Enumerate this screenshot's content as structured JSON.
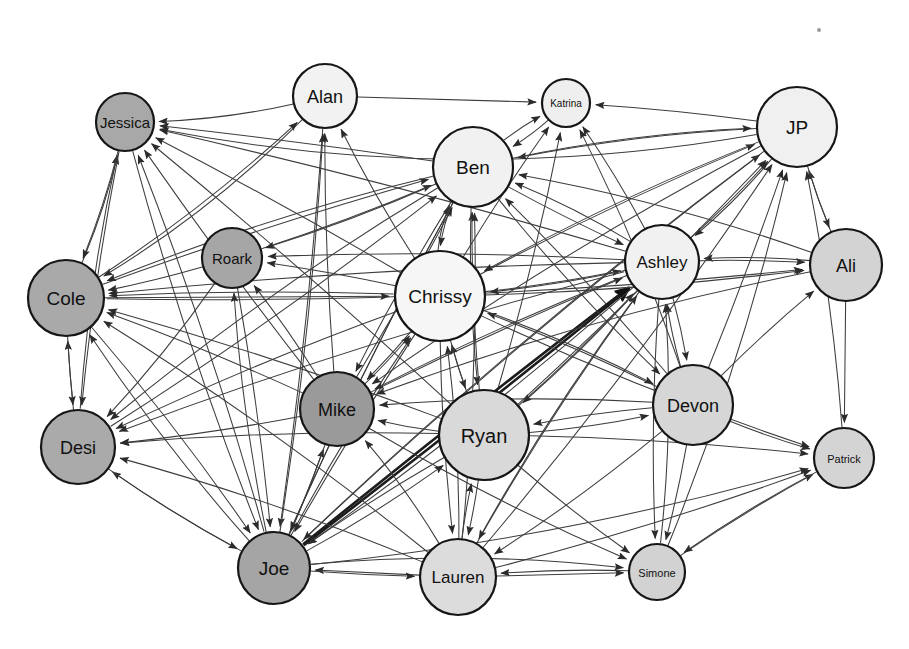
{
  "diagram": {
    "type": "directed-social-network-graph",
    "title": "",
    "background_color": "#ffffff",
    "edge_color": "#3d3d3d",
    "node_border_color": "#161616",
    "width": 909,
    "height": 649,
    "node_count": 18,
    "edge_count": 146
  },
  "nodes": [
    {
      "id": "jessica",
      "label": "Jessica",
      "x": 125,
      "y": 122,
      "r": 29,
      "fill": "#a8a8a8",
      "font_size": 15
    },
    {
      "id": "alan",
      "label": "Alan",
      "x": 325,
      "y": 96,
      "r": 32,
      "fill": "#f2f2f2",
      "font_size": 18
    },
    {
      "id": "katrina",
      "label": "Katrina",
      "x": 566,
      "y": 103,
      "r": 24,
      "fill": "#efefef",
      "font_size": 10
    },
    {
      "id": "jp",
      "label": "JP",
      "x": 797,
      "y": 127,
      "r": 40,
      "fill": "#f0f0f0",
      "font_size": 19
    },
    {
      "id": "ben",
      "label": "Ben",
      "x": 473,
      "y": 167,
      "r": 40,
      "fill": "#f1f1f1",
      "font_size": 19
    },
    {
      "id": "roark",
      "label": "Roark",
      "x": 232,
      "y": 258,
      "r": 30,
      "fill": "#a6a6a6",
      "font_size": 15
    },
    {
      "id": "ashley",
      "label": "Ashley",
      "x": 662,
      "y": 262,
      "r": 37,
      "fill": "#f1f1f1",
      "font_size": 17
    },
    {
      "id": "ali",
      "label": "Ali",
      "x": 846,
      "y": 265,
      "r": 36,
      "fill": "#d3d3d3",
      "font_size": 18
    },
    {
      "id": "cole",
      "label": "Cole",
      "x": 66,
      "y": 298,
      "r": 38,
      "fill": "#a9a9a9",
      "font_size": 19
    },
    {
      "id": "chrissy",
      "label": "Chrissy",
      "x": 440,
      "y": 296,
      "r": 45,
      "fill": "#f6f6f6",
      "font_size": 19
    },
    {
      "id": "mike",
      "label": "Mike",
      "x": 337,
      "y": 409,
      "r": 37,
      "fill": "#9a9a9a",
      "font_size": 18
    },
    {
      "id": "devon",
      "label": "Devon",
      "x": 693,
      "y": 405,
      "r": 40,
      "fill": "#d6d6d6",
      "font_size": 18
    },
    {
      "id": "ryan",
      "label": "Ryan",
      "x": 484,
      "y": 435,
      "r": 45,
      "fill": "#d9d9d9",
      "font_size": 20
    },
    {
      "id": "desi",
      "label": "Desi",
      "x": 78,
      "y": 447,
      "r": 37,
      "fill": "#aaaaaa",
      "font_size": 18
    },
    {
      "id": "patrick",
      "label": "Patrick",
      "x": 844,
      "y": 458,
      "r": 30,
      "fill": "#d4d4d4",
      "font_size": 11
    },
    {
      "id": "joe",
      "label": "Joe",
      "x": 274,
      "y": 568,
      "r": 36,
      "fill": "#a5a5a5",
      "font_size": 19
    },
    {
      "id": "lauren",
      "label": "Lauren",
      "x": 458,
      "y": 577,
      "r": 38,
      "fill": "#dcdcdc",
      "font_size": 17
    },
    {
      "id": "simone",
      "label": "Simone",
      "x": 657,
      "y": 572,
      "r": 28,
      "fill": "#d2d2d2",
      "font_size": 11
    }
  ],
  "edges": [
    {
      "from": "jp",
      "to": "jessica",
      "curve": -70,
      "thick": false
    },
    {
      "from": "alan",
      "to": "jessica",
      "curve": -14,
      "thick": false
    },
    {
      "from": "alan",
      "to": "katrina",
      "curve": 0,
      "thick": false
    },
    {
      "from": "jp",
      "to": "katrina",
      "curve": 6,
      "thick": false
    },
    {
      "from": "ben",
      "to": "katrina",
      "curve": -10,
      "thick": false
    },
    {
      "from": "ashley",
      "to": "katrina",
      "curve": 8,
      "thick": false
    },
    {
      "from": "chrissy",
      "to": "katrina",
      "curve": -6,
      "thick": false
    },
    {
      "from": "ryan",
      "to": "katrina",
      "curve": 10,
      "thick": false
    },
    {
      "from": "devon",
      "to": "katrina",
      "curve": 14,
      "thick": false
    },
    {
      "from": "cole",
      "to": "jessica",
      "curve": 12,
      "thick": false
    },
    {
      "from": "desi",
      "to": "jessica",
      "curve": -16,
      "thick": false
    },
    {
      "from": "ben",
      "to": "jessica",
      "curve": 4,
      "thick": false
    },
    {
      "from": "chrissy",
      "to": "jessica",
      "curve": 6,
      "thick": false
    },
    {
      "from": "ashley",
      "to": "jessica",
      "curve": 10,
      "thick": false
    },
    {
      "from": "ryan",
      "to": "jessica",
      "curve": 8,
      "thick": false
    },
    {
      "from": "mike",
      "to": "jessica",
      "curve": -6,
      "thick": false
    },
    {
      "from": "joe",
      "to": "jessica",
      "curve": 14,
      "thick": false
    },
    {
      "from": "jp",
      "to": "ben",
      "curve": 16,
      "thick": false
    },
    {
      "from": "ali",
      "to": "ben",
      "curve": 20,
      "thick": false
    },
    {
      "from": "katrina",
      "to": "ben",
      "curve": -12,
      "thick": false
    },
    {
      "from": "chrissy",
      "to": "ben",
      "curve": -30,
      "thick": false
    },
    {
      "from": "ashley",
      "to": "ben",
      "curve": 14,
      "thick": false
    },
    {
      "from": "cole",
      "to": "ben",
      "curve": -10,
      "thick": false
    },
    {
      "from": "roark",
      "to": "ben",
      "curve": 8,
      "thick": false
    },
    {
      "from": "mike",
      "to": "ben",
      "curve": 6,
      "thick": false
    },
    {
      "from": "ryan",
      "to": "ben",
      "curve": -10,
      "thick": false
    },
    {
      "from": "desi",
      "to": "ben",
      "curve": 14,
      "thick": false
    },
    {
      "from": "joe",
      "to": "ben",
      "curve": -12,
      "thick": false
    },
    {
      "from": "lauren",
      "to": "ben",
      "curve": 16,
      "thick": false
    },
    {
      "from": "devon",
      "to": "ben",
      "curve": 10,
      "thick": false
    },
    {
      "from": "ben",
      "to": "ashley",
      "curve": 6,
      "thick": false
    },
    {
      "from": "jp",
      "to": "ashley",
      "curve": -14,
      "thick": false
    },
    {
      "from": "ali",
      "to": "ashley",
      "curve": 12,
      "thick": false
    },
    {
      "from": "chrissy",
      "to": "ashley",
      "curve": 8,
      "thick": false
    },
    {
      "from": "devon",
      "to": "ashley",
      "curve": -10,
      "thick": false
    },
    {
      "from": "ryan",
      "to": "ashley",
      "curve": 10,
      "thick": false
    },
    {
      "from": "lauren",
      "to": "ashley",
      "curve": -14,
      "thick": false
    },
    {
      "from": "joe",
      "to": "ashley",
      "curve": 4,
      "thick": true
    },
    {
      "from": "joe",
      "to": "ashley",
      "curve": -4,
      "thick": true
    },
    {
      "from": "mike",
      "to": "ashley",
      "curve": -8,
      "thick": false
    },
    {
      "from": "simone",
      "to": "ashley",
      "curve": 18,
      "thick": false
    },
    {
      "from": "ashley",
      "to": "jp",
      "curve": 10,
      "thick": false
    },
    {
      "from": "ali",
      "to": "jp",
      "curve": -8,
      "thick": false
    },
    {
      "from": "devon",
      "to": "jp",
      "curve": 6,
      "thick": false
    },
    {
      "from": "patrick",
      "to": "jp",
      "curve": 14,
      "thick": false
    },
    {
      "from": "chrissy",
      "to": "jp",
      "curve": -12,
      "thick": false
    },
    {
      "from": "ryan",
      "to": "jp",
      "curve": 10,
      "thick": false
    },
    {
      "from": "lauren",
      "to": "jp",
      "curve": 18,
      "thick": false
    },
    {
      "from": "simone",
      "to": "jp",
      "curve": 22,
      "thick": false
    },
    {
      "from": "joe",
      "to": "jp",
      "curve": -22,
      "thick": false
    },
    {
      "from": "ben",
      "to": "jp",
      "curve": -18,
      "thick": false
    },
    {
      "from": "jp",
      "to": "ali",
      "curve": 8,
      "thick": false
    },
    {
      "from": "ashley",
      "to": "ali",
      "curve": -6,
      "thick": false
    },
    {
      "from": "cole",
      "to": "ali",
      "curve": 26,
      "thick": false
    },
    {
      "from": "chrissy",
      "to": "ali",
      "curve": 12,
      "thick": false
    },
    {
      "from": "devon",
      "to": "ali",
      "curve": -8,
      "thick": false
    },
    {
      "from": "ali",
      "to": "patrick",
      "curve": 0,
      "thick": false
    },
    {
      "from": "devon",
      "to": "patrick",
      "curve": 8,
      "thick": false
    },
    {
      "from": "ryan",
      "to": "patrick",
      "curve": -10,
      "thick": false
    },
    {
      "from": "lauren",
      "to": "patrick",
      "curve": 12,
      "thick": false
    },
    {
      "from": "simone",
      "to": "patrick",
      "curve": -8,
      "thick": false
    },
    {
      "from": "joe",
      "to": "patrick",
      "curve": 30,
      "thick": false
    },
    {
      "from": "chrissy",
      "to": "patrick",
      "curve": 16,
      "thick": false
    },
    {
      "from": "patrick",
      "to": "simone",
      "curve": 10,
      "thick": false
    },
    {
      "from": "devon",
      "to": "simone",
      "curve": -6,
      "thick": false
    },
    {
      "from": "ryan",
      "to": "simone",
      "curve": 8,
      "thick": false
    },
    {
      "from": "lauren",
      "to": "simone",
      "curve": 0,
      "thick": false
    },
    {
      "from": "ashley",
      "to": "simone",
      "curve": 12,
      "thick": false
    },
    {
      "from": "joe",
      "to": "simone",
      "curve": -24,
      "thick": false
    },
    {
      "from": "mike",
      "to": "simone",
      "curve": 14,
      "thick": false
    },
    {
      "from": "ben",
      "to": "cole",
      "curve": 20,
      "thick": false
    },
    {
      "from": "jessica",
      "to": "cole",
      "curve": -10,
      "thick": false
    },
    {
      "from": "chrissy",
      "to": "cole",
      "curve": 10,
      "thick": false
    },
    {
      "from": "ashley",
      "to": "cole",
      "curve": 14,
      "thick": false
    },
    {
      "from": "roark",
      "to": "cole",
      "curve": -6,
      "thick": false
    },
    {
      "from": "mike",
      "to": "cole",
      "curve": 8,
      "thick": false
    },
    {
      "from": "ryan",
      "to": "cole",
      "curve": 12,
      "thick": false
    },
    {
      "from": "joe",
      "to": "cole",
      "curve": -16,
      "thick": false
    },
    {
      "from": "lauren",
      "to": "cole",
      "curve": 18,
      "thick": false
    },
    {
      "from": "desi",
      "to": "cole",
      "curve": -4,
      "thick": false
    },
    {
      "from": "alan",
      "to": "cole",
      "curve": -26,
      "thick": false
    },
    {
      "from": "cole",
      "to": "desi",
      "curve": 4,
      "thick": false
    },
    {
      "from": "jessica",
      "to": "desi",
      "curve": 10,
      "thick": false
    },
    {
      "from": "chrissy",
      "to": "desi",
      "curve": 12,
      "thick": false
    },
    {
      "from": "mike",
      "to": "desi",
      "curve": -8,
      "thick": false
    },
    {
      "from": "ryan",
      "to": "desi",
      "curve": 14,
      "thick": false
    },
    {
      "from": "joe",
      "to": "desi",
      "curve": -10,
      "thick": false
    },
    {
      "from": "lauren",
      "to": "desi",
      "curve": 16,
      "thick": false
    },
    {
      "from": "ben",
      "to": "desi",
      "curve": 22,
      "thick": false
    },
    {
      "from": "ashley",
      "to": "desi",
      "curve": 18,
      "thick": false
    },
    {
      "from": "roark",
      "to": "desi",
      "curve": -12,
      "thick": false
    },
    {
      "from": "chrissy",
      "to": "roark",
      "curve": 6,
      "thick": false
    },
    {
      "from": "ben",
      "to": "roark",
      "curve": -10,
      "thick": false
    },
    {
      "from": "ashley",
      "to": "roark",
      "curve": 12,
      "thick": false
    },
    {
      "from": "joe",
      "to": "roark",
      "curve": -14,
      "thick": false
    },
    {
      "from": "mike",
      "to": "roark",
      "curve": 8,
      "thick": false
    },
    {
      "from": "ben",
      "to": "chrissy",
      "curve": 26,
      "thick": false
    },
    {
      "from": "ashley",
      "to": "chrissy",
      "curve": -10,
      "thick": false
    },
    {
      "from": "jp",
      "to": "chrissy",
      "curve": 16,
      "thick": false
    },
    {
      "from": "ryan",
      "to": "chrissy",
      "curve": -8,
      "thick": false
    },
    {
      "from": "mike",
      "to": "chrissy",
      "curve": 10,
      "thick": false
    },
    {
      "from": "joe",
      "to": "chrissy",
      "curve": -12,
      "thick": false
    },
    {
      "from": "lauren",
      "to": "chrissy",
      "curve": 14,
      "thick": false
    },
    {
      "from": "cole",
      "to": "chrissy",
      "curve": 0,
      "thick": false
    },
    {
      "from": "devon",
      "to": "chrissy",
      "curve": 10,
      "thick": false
    },
    {
      "from": "ben",
      "to": "mike",
      "curve": 8,
      "thick": false
    },
    {
      "from": "chrissy",
      "to": "mike",
      "curve": -6,
      "thick": false
    },
    {
      "from": "ashley",
      "to": "mike",
      "curve": 12,
      "thick": false
    },
    {
      "from": "ryan",
      "to": "mike",
      "curve": -10,
      "thick": false
    },
    {
      "from": "joe",
      "to": "mike",
      "curve": 6,
      "thick": false
    },
    {
      "from": "lauren",
      "to": "mike",
      "curve": 14,
      "thick": false
    },
    {
      "from": "jp",
      "to": "mike",
      "curve": 20,
      "thick": false
    },
    {
      "from": "devon",
      "to": "mike",
      "curve": 16,
      "thick": false
    },
    {
      "from": "ali",
      "to": "mike",
      "curve": 24,
      "thick": false
    },
    {
      "from": "chrissy",
      "to": "ryan",
      "curve": 8,
      "thick": false
    },
    {
      "from": "ashley",
      "to": "ryan",
      "curve": -12,
      "thick": false
    },
    {
      "from": "ben",
      "to": "ryan",
      "curve": 14,
      "thick": false
    },
    {
      "from": "lauren",
      "to": "ryan",
      "curve": -8,
      "thick": false
    },
    {
      "from": "devon",
      "to": "ryan",
      "curve": 10,
      "thick": false
    },
    {
      "from": "joe",
      "to": "ryan",
      "curve": 12,
      "thick": false
    },
    {
      "from": "jessica",
      "to": "joe",
      "curve": 16,
      "thick": false
    },
    {
      "from": "cole",
      "to": "joe",
      "curve": -12,
      "thick": false
    },
    {
      "from": "desi",
      "to": "joe",
      "curve": 10,
      "thick": false
    },
    {
      "from": "roark",
      "to": "joe",
      "curve": -8,
      "thick": false
    },
    {
      "from": "chrissy",
      "to": "joe",
      "curve": 6,
      "thick": false
    },
    {
      "from": "mike",
      "to": "joe",
      "curve": -6,
      "thick": false
    },
    {
      "from": "ben",
      "to": "joe",
      "curve": 12,
      "thick": false
    },
    {
      "from": "ashley",
      "to": "joe",
      "curve": -14,
      "thick": false
    },
    {
      "from": "ryan",
      "to": "joe",
      "curve": 8,
      "thick": false
    },
    {
      "from": "lauren",
      "to": "joe",
      "curve": 0,
      "thick": false
    },
    {
      "from": "alan",
      "to": "joe",
      "curve": -10,
      "thick": false
    },
    {
      "from": "jp",
      "to": "joe",
      "curve": 24,
      "thick": false
    },
    {
      "from": "chrissy",
      "to": "lauren",
      "curve": 10,
      "thick": false
    },
    {
      "from": "ryan",
      "to": "lauren",
      "curve": -6,
      "thick": false
    },
    {
      "from": "joe",
      "to": "lauren",
      "curve": 4,
      "thick": false
    },
    {
      "from": "ashley",
      "to": "lauren",
      "curve": 16,
      "thick": false
    },
    {
      "from": "devon",
      "to": "lauren",
      "curve": -12,
      "thick": false
    },
    {
      "from": "simone",
      "to": "lauren",
      "curve": 8,
      "thick": false
    },
    {
      "from": "mike",
      "to": "alan",
      "curve": -8,
      "thick": false
    },
    {
      "from": "joe",
      "to": "alan",
      "curve": 14,
      "thick": false
    },
    {
      "from": "chrissy",
      "to": "alan",
      "curve": -10,
      "thick": false
    },
    {
      "from": "cole",
      "to": "alan",
      "curve": 18,
      "thick": false
    },
    {
      "from": "ben",
      "to": "devon",
      "curve": 14,
      "thick": false
    },
    {
      "from": "ashley",
      "to": "devon",
      "curve": -8,
      "thick": false
    },
    {
      "from": "ryan",
      "to": "devon",
      "curve": 12,
      "thick": false
    },
    {
      "from": "chrissy",
      "to": "devon",
      "curve": -14,
      "thick": false
    }
  ],
  "specks": [
    {
      "x": 819,
      "y": 30,
      "r": 2
    }
  ]
}
